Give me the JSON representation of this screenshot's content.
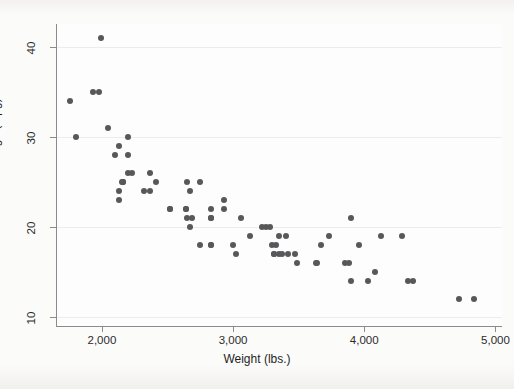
{
  "chart_data": {
    "type": "scatter",
    "title": "",
    "xlabel": "Weight (lbs.)",
    "ylabel": "Mileage (mpg)",
    "xlim": [
      1650,
      5050
    ],
    "ylim": [
      9.0,
      42.5
    ],
    "xticks": [
      2000,
      3000,
      4000,
      5000
    ],
    "xtick_labels": [
      "2,000",
      "3,000",
      "4,000",
      "5,000"
    ],
    "yticks": [
      10,
      20,
      30,
      40
    ],
    "ytick_labels": [
      "10",
      "20",
      "30",
      "40"
    ],
    "grid": "horizontal",
    "legend": "none",
    "marker_color": "#58585a",
    "marker_size_px": 6,
    "n_points": 74,
    "series": [
      {
        "name": "Automobiles",
        "x": [
          2930,
          3350,
          2640,
          3250,
          4080,
          3670,
          2230,
          3280,
          3880,
          3400,
          3350,
          3900,
          4330,
          3900,
          4290,
          3730,
          3960,
          4130,
          4370,
          2690,
          2130,
          2650,
          1800,
          2750,
          2100,
          3470,
          2830,
          1980,
          3220,
          2520,
          3330,
          2160,
          2670,
          2370,
          3130,
          2830,
          2200,
          3300,
          2160,
          2520,
          3420,
          3850,
          4030,
          3640,
          2640,
          2830,
          2130,
          3060,
          4720,
          4840,
          3310,
          3020,
          2830,
          2750,
          3310,
          3630,
          3490,
          2320,
          3000,
          2830,
          3370,
          2930,
          2200,
          2150,
          2670,
          2370,
          2130,
          2650,
          1760,
          2050,
          2410,
          2200,
          1930,
          1990
        ],
        "y": [
          22,
          17,
          22,
          20,
          15,
          18,
          26,
          20,
          16,
          19,
          19,
          14,
          14,
          21,
          19,
          19,
          18,
          19,
          14,
          21,
          23,
          21,
          30,
          18,
          28,
          17,
          18,
          35,
          20,
          22,
          18,
          25,
          20,
          26,
          19,
          22,
          26,
          18,
          25,
          22,
          17,
          16,
          14,
          16,
          22,
          21,
          29,
          21,
          12,
          12,
          17,
          17,
          18,
          25,
          17,
          16,
          16,
          24,
          18,
          21,
          17,
          23,
          28,
          25,
          24,
          24,
          24,
          25,
          34,
          31,
          25,
          30,
          35,
          41
        ]
      }
    ]
  },
  "axis": {
    "y_title": "Mileage (mpg)",
    "x_title": "Weight (lbs.)"
  }
}
